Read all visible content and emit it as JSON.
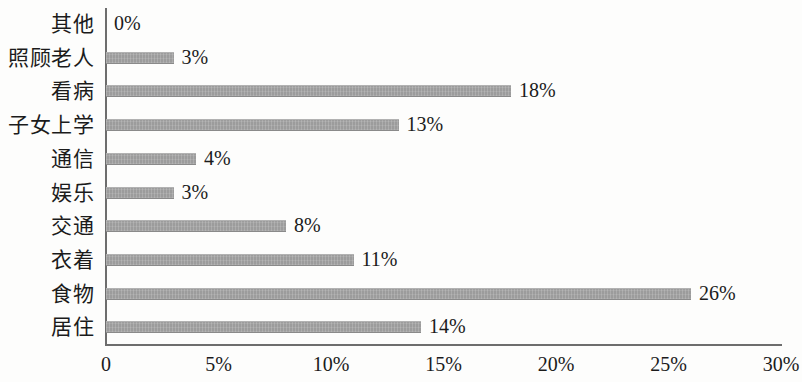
{
  "chart_data": {
    "type": "bar",
    "orientation": "horizontal",
    "title": "",
    "subtitle": "",
    "xlabel": "",
    "ylabel": "",
    "categories": [
      "其他",
      "照顾老人",
      "看病",
      "子女上学",
      "通信",
      "娱乐",
      "交通",
      "衣着",
      "食物",
      "居住"
    ],
    "values": [
      0,
      3,
      18,
      13,
      4,
      3,
      8,
      11,
      26,
      14
    ],
    "value_labels": [
      "0%",
      "3%",
      "18%",
      "13%",
      "4%",
      "3%",
      "8%",
      "11%",
      "26%",
      "14%"
    ],
    "xlim": [
      0,
      30
    ],
    "x_ticks": [
      0,
      5,
      10,
      15,
      20,
      25,
      30
    ],
    "x_tick_labels": [
      "0",
      "5%",
      "10%",
      "15%",
      "20%",
      "25%",
      "30%"
    ],
    "grid": false,
    "legend": null,
    "bar_color": "#9c9c9c",
    "axis_color": "#6d6d6d",
    "text_color": "#1b1b1b",
    "background_color": "#fdfdfc"
  }
}
